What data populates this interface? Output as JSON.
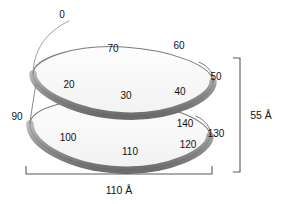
{
  "figure": {
    "background_color": "#ffffff",
    "ribbon_color_dark": "#6f6f6f",
    "ribbon_color_mid": "#9a9a9a",
    "ribbon_color_light": "#d8d8d8",
    "outline_color": "#6a6a6a",
    "dimension_color": "#555555",
    "text_color": "#111111"
  },
  "position_labels": [
    {
      "text": "0",
      "x": 62,
      "y": 15
    },
    {
      "text": "20",
      "x": 69,
      "y": 85
    },
    {
      "text": "30",
      "x": 126,
      "y": 96
    },
    {
      "text": "40",
      "x": 180,
      "y": 92
    },
    {
      "text": "50",
      "x": 216,
      "y": 77
    },
    {
      "text": "60",
      "x": 179,
      "y": 46
    },
    {
      "text": "70",
      "x": 113,
      "y": 49
    },
    {
      "text": "90",
      "x": 17,
      "y": 117
    },
    {
      "text": "100",
      "x": 68,
      "y": 138
    },
    {
      "text": "110",
      "x": 130,
      "y": 152
    },
    {
      "text": "120",
      "x": 188,
      "y": 145
    },
    {
      "text": "130",
      "x": 216,
      "y": 134
    },
    {
      "text": "140",
      "x": 185,
      "y": 124
    }
  ],
  "dimensions": {
    "height": {
      "value": "55 Å",
      "label_x": 261,
      "label_y": 115
    },
    "width": {
      "value": "110 Å",
      "label_x": 119,
      "label_y": 190
    }
  }
}
